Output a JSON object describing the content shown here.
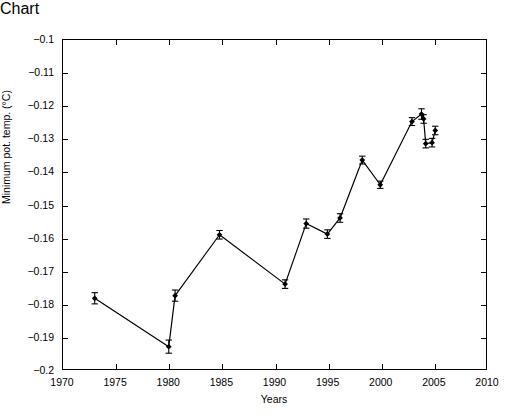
{
  "chart_data": {
    "type": "line",
    "title": "",
    "xlabel": "Years",
    "ylabel": "Minimum pot. temp. (°C)",
    "xlim": [
      1970,
      2010
    ],
    "ylim": [
      -0.2,
      -0.1
    ],
    "xticks": [
      1970,
      1975,
      1980,
      1985,
      1990,
      1995,
      2000,
      2005,
      2010
    ],
    "xtick_labels": [
      "1970",
      "1975",
      "1980",
      "1985",
      "1990",
      "1995",
      "2000",
      "2005",
      "2010"
    ],
    "yticks": [
      -0.2,
      -0.19,
      -0.18,
      -0.17,
      -0.16,
      -0.15,
      -0.14,
      -0.13,
      -0.12,
      -0.11,
      -0.1
    ],
    "ytick_labels": [
      "-0.2",
      "-0.19",
      "-0.18",
      "-0.17",
      "-0.16",
      "-0.15",
      "-0.14",
      "-0.13",
      "-0.12",
      "-0.11",
      "-0.1"
    ],
    "grid": false,
    "legend": null,
    "marker": "filled-diamond",
    "line_color": "#000000",
    "marker_color": "#000000",
    "errorbar_style": "vertical-capped",
    "series": [
      {
        "name": "Minimum potential temperature",
        "x": [
          1973.0,
          1980.0,
          1980.6,
          1984.8,
          1991.0,
          1993.0,
          1995.0,
          1996.2,
          1998.3,
          2000.0,
          2003.0,
          2003.9,
          2004.1,
          2004.3,
          2004.9,
          2005.2
        ],
        "y": [
          -0.1785,
          -0.1932,
          -0.1777,
          -0.1592,
          -0.1742,
          -0.1558,
          -0.159,
          -0.1541,
          -0.1365,
          -0.144,
          -0.1248,
          -0.1225,
          -0.124,
          -0.1315,
          -0.1312,
          -0.1275
        ],
        "yerr": [
          0.0017,
          0.002,
          0.0017,
          0.0013,
          0.0013,
          0.0014,
          0.0013,
          0.0013,
          0.0012,
          0.0011,
          0.0012,
          0.0016,
          0.0013,
          0.0013,
          0.0013,
          0.0013
        ]
      }
    ]
  }
}
